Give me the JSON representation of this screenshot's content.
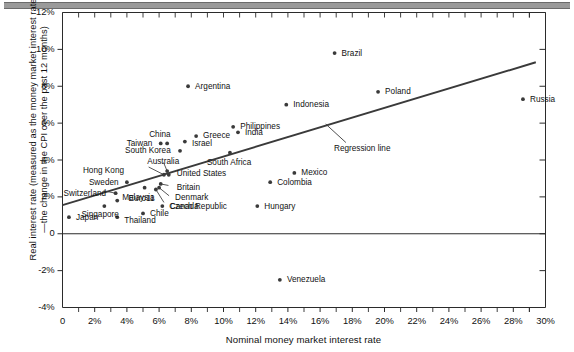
{
  "figure": {
    "x_axis_title": "Nominal money market interest rate",
    "y_axis_title": "Real interest rate (measured as the money market interest rate—the change in the CPI over the past 12 months)",
    "regression_annotation": "Regression line"
  },
  "chart_data": {
    "type": "scatter",
    "title": "",
    "xlabel": "Nominal money market interest rate",
    "ylabel": "Real interest rate (measured as the money market interest rate—the change in the CPI over the past 12 months)",
    "xlim": [
      0,
      30
    ],
    "ylim": [
      -4,
      12
    ],
    "grid": false,
    "legend": "none",
    "x_unit": "%",
    "y_unit": "%",
    "xticks": [
      "0",
      "2%",
      "4%",
      "6%",
      "8%",
      "10%",
      "12%",
      "14%",
      "16%",
      "18%",
      "20%",
      "22%",
      "24%",
      "26%",
      "28%",
      "30%"
    ],
    "xtick_values": [
      0,
      2,
      4,
      6,
      8,
      10,
      12,
      14,
      16,
      18,
      20,
      22,
      24,
      26,
      28,
      30
    ],
    "yticks": [
      "12%",
      "10%",
      "8%",
      "6%",
      "4%",
      "2%",
      "0",
      "-2%",
      "-4%"
    ],
    "ytick_values": [
      12,
      10,
      8,
      6,
      4,
      2,
      0,
      -2,
      -4
    ],
    "zero_line": 0,
    "annotations": [
      {
        "text": "Regression line",
        "x": 18.6,
        "y": 4.6
      }
    ],
    "series": [
      {
        "name": "Countries",
        "points": [
          {
            "label": "Japan",
            "x": 0.4,
            "y": 0.9,
            "lx": 7,
            "ly": 0,
            "align": "left"
          },
          {
            "label": "Singapore",
            "x": 2.6,
            "y": 1.5,
            "lx": -4,
            "ly": 8,
            "align": "center"
          },
          {
            "label": "Thailand",
            "x": 3.4,
            "y": 0.9,
            "lx": 7,
            "ly": 3,
            "align": "left"
          },
          {
            "label": "Switzerland",
            "x": 3.3,
            "y": 2.2,
            "lx": -9,
            "ly": 0,
            "align": "right"
          },
          {
            "label": "Malaysia",
            "x": 3.4,
            "y": 1.8,
            "lx": 5,
            "ly": -3,
            "align": "left"
          },
          {
            "label": "Sweden",
            "x": 4.0,
            "y": 2.8,
            "lx": -8,
            "ly": 0,
            "align": "right"
          },
          {
            "label": "Chile",
            "x": 5.0,
            "y": 1.1,
            "lx": 7,
            "ly": 0,
            "align": "left"
          },
          {
            "label": "Euro11",
            "x": 5.1,
            "y": 2.5,
            "lx": -3,
            "ly": 11,
            "align": "center"
          },
          {
            "label": "Canada",
            "x": 5.8,
            "y": 2.4,
            "lx": 14,
            "ly": 17,
            "align": "left"
          },
          {
            "label": "Denmark",
            "x": 6.0,
            "y": 2.5,
            "lx": 16,
            "ly": 10,
            "align": "left"
          },
          {
            "label": "Britain",
            "x": 6.1,
            "y": 2.7,
            "lx": 16,
            "ly": 4,
            "align": "left"
          },
          {
            "label": "Czech Republic",
            "x": 6.2,
            "y": 1.5,
            "lx": 7,
            "ly": 0,
            "align": "left"
          },
          {
            "label": "Hong Kong",
            "x": 6.3,
            "y": 3.2,
            "lx": -40,
            "ly": -4,
            "align": "right"
          },
          {
            "label": "Australia",
            "x": 6.5,
            "y": 3.4,
            "lx": -4,
            "ly": -10,
            "align": "center"
          },
          {
            "label": "United States",
            "x": 6.6,
            "y": 3.2,
            "lx": 8,
            "ly": -1,
            "align": "left"
          },
          {
            "label": "China",
            "x": 6.5,
            "y": 4.9,
            "lx": -7,
            "ly": -9,
            "align": "center"
          },
          {
            "label": "Taiwan",
            "x": 6.1,
            "y": 4.9,
            "lx": -8,
            "ly": 0,
            "align": "right"
          },
          {
            "label": "South Korea",
            "x": 7.3,
            "y": 4.5,
            "lx": -9,
            "ly": 0,
            "align": "right"
          },
          {
            "label": "Israel",
            "x": 7.6,
            "y": 5.0,
            "lx": 7,
            "ly": 2,
            "align": "left"
          },
          {
            "label": "Argentina",
            "x": 7.8,
            "y": 8.0,
            "lx": 7,
            "ly": 0,
            "align": "left"
          },
          {
            "label": "Greece",
            "x": 8.3,
            "y": 5.3,
            "lx": 7,
            "ly": 0,
            "align": "left"
          },
          {
            "label": "South Africa",
            "x": 10.4,
            "y": 4.4,
            "lx": -1,
            "ly": 10,
            "align": "center"
          },
          {
            "label": "Philippines",
            "x": 10.6,
            "y": 5.8,
            "lx": 7,
            "ly": 0,
            "align": "left"
          },
          {
            "label": "India",
            "x": 10.9,
            "y": 5.5,
            "lx": 7,
            "ly": 0,
            "align": "left"
          },
          {
            "label": "Hungary",
            "x": 12.1,
            "y": 1.5,
            "lx": 7,
            "ly": 0,
            "align": "left"
          },
          {
            "label": "Colombia",
            "x": 12.9,
            "y": 2.8,
            "lx": 7,
            "ly": 0,
            "align": "left"
          },
          {
            "label": "Venezuela",
            "x": 13.5,
            "y": -2.5,
            "lx": 7,
            "ly": 0,
            "align": "left"
          },
          {
            "label": "Indonesia",
            "x": 13.9,
            "y": 7.0,
            "lx": 7,
            "ly": 0,
            "align": "left"
          },
          {
            "label": "Mexico",
            "x": 14.4,
            "y": 3.3,
            "lx": 7,
            "ly": 0,
            "align": "left"
          },
          {
            "label": "Brazil",
            "x": 16.9,
            "y": 9.8,
            "lx": 7,
            "ly": 0,
            "align": "left"
          },
          {
            "label": "Poland",
            "x": 19.6,
            "y": 7.7,
            "lx": 7,
            "ly": 0,
            "align": "left"
          },
          {
            "label": "Russia",
            "x": 28.6,
            "y": 7.3,
            "lx": 7,
            "ly": 0,
            "align": "left"
          }
        ]
      }
    ],
    "regression_line": {
      "x1": 0.0,
      "y1": 1.55,
      "x2": 29.4,
      "y2": 9.3,
      "label": "Regression line"
    }
  }
}
